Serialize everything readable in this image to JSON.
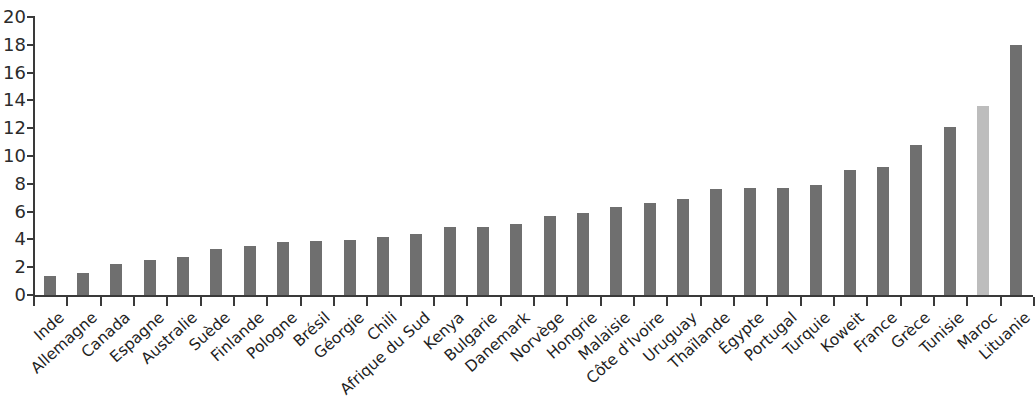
{
  "chart_data": {
    "type": "bar",
    "title": "",
    "subtitle": "",
    "xlabel": "",
    "ylabel": "",
    "ylim": [
      0,
      20
    ],
    "ytick_step": 2,
    "yticks": [
      0,
      2,
      4,
      6,
      8,
      10,
      12,
      14,
      16,
      18,
      20
    ],
    "ytick_labels": [
      "0",
      "2",
      "4",
      "6",
      "8",
      "10",
      "12",
      "14",
      "16",
      "18",
      "20"
    ],
    "grid": false,
    "legend": "none",
    "bar_color": "#6f6f6f",
    "highlight_color": "#bdbdbd",
    "highlight_category": "Maroc",
    "axis_color": "#3a3a3a",
    "background": "#ffffff",
    "categories": [
      "Inde",
      "Allemagne",
      "Canada",
      "Espagne",
      "Australie",
      "Suède",
      "Finlande",
      "Pologne",
      "Brésil",
      "Géorgie",
      "Chili",
      "Afrique du Sud",
      "Kenya",
      "Bulgarie",
      "Danemark",
      "Norvège",
      "Hongrie",
      "Malaisie",
      "Côte d'Ivoire",
      "Uruguay",
      "Thaïlande",
      "Égypte",
      "Portugal",
      "Turquie",
      "Koweit",
      "France",
      "Grèce",
      "Tunisie",
      "Maroc",
      "Lituanie"
    ],
    "values": [
      1.4,
      1.6,
      2.2,
      2.5,
      2.7,
      3.3,
      3.5,
      3.8,
      3.9,
      3.95,
      4.2,
      4.4,
      4.9,
      4.9,
      5.1,
      5.7,
      5.9,
      6.3,
      6.6,
      6.9,
      7.6,
      7.7,
      7.7,
      7.9,
      9.0,
      9.2,
      10.8,
      12.1,
      13.6,
      18.0
    ]
  }
}
